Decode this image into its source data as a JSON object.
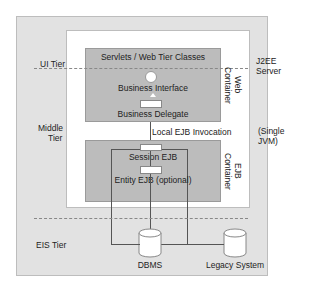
{
  "diagram": {
    "tiers": {
      "ui": "UI Tier",
      "middle_line1": "Middle",
      "middle_line2": "Tier",
      "eis": "EIS Tier"
    },
    "server": {
      "line1": "J2EE",
      "line2": "Server",
      "jvm_line1": "(Single",
      "jvm_line2": "JVM)"
    },
    "web_container": {
      "label_line1": "Web",
      "label_line2": "Container",
      "title": "Servlets / Web Tier Classes",
      "business_interface": "Business Interface",
      "business_delegate": "Business Delegate"
    },
    "invocation": "Local EJB Invocation",
    "ejb_container": {
      "label_line1": "EJB",
      "label_line2": "Container",
      "session_ejb": "Session EJB",
      "entity_ejb": "Entity EJB (optional)"
    },
    "resources": {
      "dbms": "DBMS",
      "legacy": "Legacy System"
    },
    "colors": {
      "outer_bg": "#e2e2e2",
      "server_bg": "#ffffff",
      "container_bg": "#bcbcbc"
    }
  }
}
